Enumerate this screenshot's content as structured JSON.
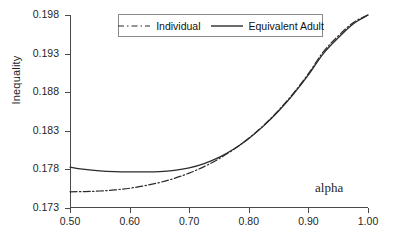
{
  "chart_data": {
    "type": "line",
    "title": "",
    "subtitle": "",
    "xlabel": "alpha",
    "ylabel": "Inequality",
    "xlim": [
      0.5,
      1.0
    ],
    "ylim": [
      0.173,
      0.198
    ],
    "xticks": [
      "0.50",
      "0.60",
      "0.70",
      "0.80",
      "0.90",
      "1.00"
    ],
    "xtick_values": [
      0.5,
      0.6,
      0.7,
      0.8,
      0.9,
      1.0
    ],
    "yticks": [
      "0.173",
      "0.178",
      "0.183",
      "0.188",
      "0.193",
      "0.198"
    ],
    "ytick_values": [
      0.173,
      0.178,
      0.183,
      0.188,
      0.193,
      0.198
    ],
    "grid": false,
    "legend_position": "top-center",
    "annotations": [
      {
        "text": "alpha",
        "x": 0.955,
        "y": 0.1752
      }
    ],
    "x": [
      0.5,
      0.525,
      0.55,
      0.575,
      0.6,
      0.625,
      0.65,
      0.675,
      0.7,
      0.725,
      0.75,
      0.775,
      0.8,
      0.825,
      0.85,
      0.875,
      0.9,
      0.925,
      0.95,
      0.975,
      1.0
    ],
    "series": [
      {
        "name": "Individual",
        "style": "dash-dot",
        "color": "#2b2b2b",
        "values": [
          0.1751,
          0.17513,
          0.1752,
          0.17534,
          0.17556,
          0.17588,
          0.1763,
          0.17684,
          0.17752,
          0.17836,
          0.17938,
          0.1806,
          0.18204,
          0.18372,
          0.18566,
          0.18788,
          0.1904,
          0.19324,
          0.19528,
          0.197,
          0.198
        ]
      },
      {
        "name": "Equivalent Adult",
        "style": "solid",
        "color": "#2b2b2b",
        "values": [
          0.1783,
          0.178,
          0.17782,
          0.17772,
          0.17768,
          0.17768,
          0.17772,
          0.17788,
          0.1782,
          0.17876,
          0.17956,
          0.18064,
          0.182,
          0.18364,
          0.18556,
          0.18776,
          0.19024,
          0.193,
          0.19504,
          0.19684,
          0.198
        ]
      }
    ]
  },
  "legend": {
    "items": [
      {
        "label": "Individual",
        "style": "dash-dot"
      },
      {
        "label": "Equivalent Adult",
        "style": "solid"
      }
    ]
  },
  "axes": {
    "y_title": "Inequality",
    "x_annotation": "alpha"
  },
  "colors": {
    "axis": "#4a4a4a",
    "line": "#2b2b2b",
    "text": "#1f1f1f",
    "background": "#ffffff"
  }
}
